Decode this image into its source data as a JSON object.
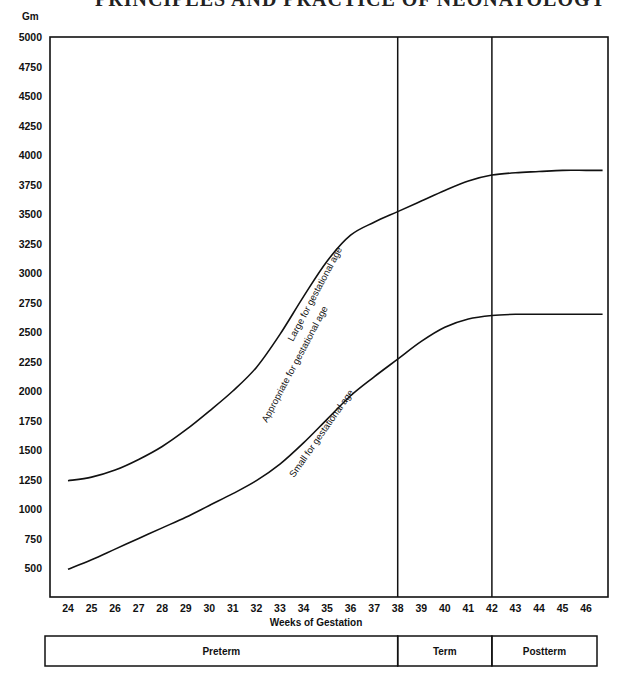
{
  "header": {
    "cut_off_title": "PRINCIPLES AND PRACTICE OF NEONATOLOGY"
  },
  "chart_data": {
    "type": "line",
    "title": "",
    "ylabel": "Gm",
    "xlabel": "Weeks of Gestation",
    "ylim": [
      250,
      5000
    ],
    "xlim": [
      24,
      46.8
    ],
    "grid": false,
    "yticks": [
      500,
      750,
      1000,
      1250,
      1500,
      1750,
      2000,
      2250,
      2500,
      2750,
      3000,
      3250,
      3500,
      3750,
      4000,
      4250,
      4500,
      4750,
      5000
    ],
    "xticks": [
      24,
      25,
      26,
      27,
      28,
      29,
      30,
      31,
      32,
      33,
      34,
      35,
      36,
      37,
      38,
      39,
      40,
      41,
      42,
      43,
      44,
      45,
      46
    ],
    "x": [
      24,
      25,
      26,
      27,
      28,
      29,
      30,
      31,
      32,
      33,
      34,
      35,
      36,
      37,
      38,
      39,
      40,
      41,
      42,
      43,
      44,
      45,
      46,
      46.7
    ],
    "series": [
      {
        "name": "Upper boundary (Large / Appropriate)",
        "values": [
          1240,
          1270,
          1330,
          1420,
          1530,
          1670,
          1830,
          2000,
          2200,
          2480,
          2800,
          3100,
          3320,
          3430,
          3520,
          3610,
          3700,
          3780,
          3830,
          3850,
          3860,
          3870,
          3870,
          3870
        ]
      },
      {
        "name": "Lower boundary (Appropriate / Small)",
        "values": [
          490,
          570,
          660,
          750,
          840,
          930,
          1030,
          1130,
          1240,
          1380,
          1560,
          1760,
          1960,
          2120,
          2270,
          2420,
          2540,
          2610,
          2640,
          2650,
          2650,
          2650,
          2650,
          2650
        ]
      }
    ],
    "vertical_lines": [
      38,
      42
    ],
    "annotations": [
      {
        "text": "Large for gestational age",
        "region": "above upper curve"
      },
      {
        "text": "Appropriate for gestational age",
        "region": "between curves"
      },
      {
        "text": "Small for gestational age",
        "region": "below lower curve"
      }
    ],
    "period_bar": [
      {
        "label": "Preterm",
        "from": 24,
        "to": 38
      },
      {
        "label": "Term",
        "from": 38,
        "to": 42
      },
      {
        "label": "Postterm",
        "from": 42,
        "to": 46.8
      }
    ]
  }
}
